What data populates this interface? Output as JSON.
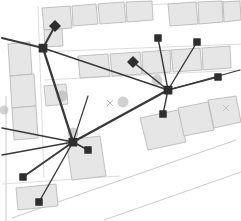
{
  "view": {
    "type": "map-network-overlay",
    "width": 241,
    "height": 221,
    "background_color": "#ffffff",
    "title": "Network links over building footprint map"
  },
  "style": {
    "building_fill": "#e6e6e6",
    "building_stroke": "#b4b4b4",
    "parcel_stroke": "#d8d8d8",
    "road_stroke": "#cfcfcf",
    "edge_color": "#3a3a3a",
    "node_color": "#2e2e2e",
    "halo_color": "#b5b5b5",
    "cross_color": "#bdbdbd"
  },
  "legend_note": "",
  "nodes": [
    {
      "id": "hub-a",
      "name": "hub-node-a",
      "x": 43,
      "y": 48,
      "shape": "square",
      "size": 7,
      "role": "hub"
    },
    {
      "id": "hub-b",
      "name": "hub-node-b",
      "x": 168,
      "y": 90,
      "shape": "square",
      "size": 7,
      "role": "hub"
    },
    {
      "id": "hub-c",
      "name": "hub-node-c",
      "x": 73,
      "y": 142,
      "shape": "square",
      "size": 7,
      "role": "hub"
    },
    {
      "id": "n1",
      "name": "endpoint-top-left",
      "x": 55,
      "y": 26,
      "shape": "diamond",
      "size": 6,
      "role": "endpoint"
    },
    {
      "id": "n2",
      "name": "endpoint-mid-center",
      "x": 133,
      "y": 62,
      "shape": "diamond",
      "size": 6,
      "role": "endpoint"
    },
    {
      "id": "n3",
      "name": "endpoint-top-center",
      "x": 158,
      "y": 38,
      "shape": "square",
      "size": 6,
      "role": "endpoint"
    },
    {
      "id": "n4",
      "name": "endpoint-top-right",
      "x": 197,
      "y": 42,
      "shape": "square",
      "size": 6,
      "role": "endpoint"
    },
    {
      "id": "n5",
      "name": "endpoint-right",
      "x": 218,
      "y": 77,
      "shape": "square",
      "size": 6,
      "role": "endpoint"
    },
    {
      "id": "n6",
      "name": "endpoint-lower-right",
      "x": 163,
      "y": 114,
      "shape": "square",
      "size": 6,
      "role": "endpoint"
    },
    {
      "id": "n7",
      "name": "endpoint-below-hub-c",
      "x": 88,
      "y": 150,
      "shape": "square",
      "size": 6,
      "role": "endpoint"
    },
    {
      "id": "n8",
      "name": "endpoint-bottom-left",
      "x": 23,
      "y": 177,
      "shape": "square",
      "size": 6,
      "role": "endpoint"
    },
    {
      "id": "n9",
      "name": "endpoint-bottom",
      "x": 39,
      "y": 202,
      "shape": "square",
      "size": 6,
      "role": "endpoint"
    }
  ],
  "edges": [
    {
      "name": "edge-huba-n1",
      "from": "hub-a",
      "to": "n1",
      "width": 2.0
    },
    {
      "name": "edge-huba-left",
      "x1": 43,
      "y1": 48,
      "x2": 2,
      "y2": 38,
      "width": 2.0
    },
    {
      "name": "edge-huba-hubc",
      "from": "hub-a",
      "to": "hub-c",
      "width": 2.4
    },
    {
      "name": "edge-huba-hubb",
      "from": "hub-a",
      "to": "hub-b",
      "width": 1.6
    },
    {
      "name": "edge-hubb-n2",
      "from": "hub-b",
      "to": "n2",
      "width": 1.6
    },
    {
      "name": "edge-hubb-n3",
      "from": "hub-b",
      "to": "n3",
      "width": 1.4
    },
    {
      "name": "edge-hubb-n4",
      "from": "hub-b",
      "to": "n4",
      "width": 1.4
    },
    {
      "name": "edge-hubb-n5",
      "from": "hub-b",
      "to": "n5",
      "width": 1.4
    },
    {
      "name": "edge-hubb-n6",
      "from": "hub-b",
      "to": "n6",
      "width": 1.4
    },
    {
      "name": "edge-hubb-hubc",
      "from": "hub-b",
      "to": "hub-c",
      "width": 2.4
    },
    {
      "name": "edge-hubc-n7",
      "from": "hub-c",
      "to": "n7",
      "width": 1.6
    },
    {
      "name": "edge-hubc-n8",
      "from": "hub-c",
      "to": "n8",
      "width": 2.0
    },
    {
      "name": "edge-hubc-n9",
      "from": "hub-c",
      "to": "n9",
      "width": 1.4
    },
    {
      "name": "edge-hubc-west",
      "x1": 73,
      "y1": 142,
      "x2": 2,
      "y2": 128,
      "width": 1.6
    },
    {
      "name": "edge-hubc-left2",
      "x1": 73,
      "y1": 142,
      "x2": 2,
      "y2": 155,
      "width": 1.4
    },
    {
      "name": "edge-hubc-north",
      "x1": 73,
      "y1": 142,
      "x2": 88,
      "y2": 96,
      "width": 1.2
    },
    {
      "name": "edge-hubb-far-east",
      "x1": 168,
      "y1": 90,
      "x2": 240,
      "y2": 70,
      "width": 1.2
    }
  ],
  "halos": [
    {
      "name": "halo-marker-1",
      "x": 62,
      "y": 96,
      "r": 5.5
    },
    {
      "name": "halo-marker-2",
      "x": 123,
      "y": 102,
      "r": 5.5
    },
    {
      "name": "halo-marker-3",
      "x": 73,
      "y": 133,
      "r": 5.5
    },
    {
      "name": "halo-marker-4",
      "x": 157,
      "y": 80,
      "r": 5.5
    },
    {
      "name": "halo-marker-5",
      "x": 4,
      "y": 110,
      "r": 4.5
    }
  ],
  "cross_marks": [
    {
      "name": "cross-mark-center",
      "x": 110,
      "y": 103,
      "size": 3
    },
    {
      "name": "cross-mark-right",
      "x": 226,
      "y": 108,
      "size": 3
    }
  ],
  "buildings": [
    {
      "name": "building-top-left-a",
      "points": "42,8 70,6 72,28 44,30"
    },
    {
      "name": "building-top-left-b",
      "points": "44,30 62,29 63,46 45,47"
    },
    {
      "name": "building-top-left-c",
      "points": "72,6 96,4 98,24 73,26"
    },
    {
      "name": "building-top-mid-a",
      "points": "98,4 124,2 126,22 100,24"
    },
    {
      "name": "building-top-mid-b",
      "points": "126,2 152,1 153,20 127,22"
    },
    {
      "name": "building-top-right-a",
      "points": "168,4 196,2 198,24 170,26"
    },
    {
      "name": "building-top-right-b",
      "points": "198,2 222,1 223,22 199,24"
    },
    {
      "name": "building-top-right-c",
      "points": "223,2 240,1 241,20 224,22"
    },
    {
      "name": "building-row-a",
      "points": "78,56 108,54 110,76 80,78"
    },
    {
      "name": "building-row-b",
      "points": "110,54 140,52 142,74 112,76"
    },
    {
      "name": "building-row-c",
      "points": "142,52 170,50 171,72 143,74"
    },
    {
      "name": "building-row-d",
      "points": "171,50 200,48 202,70 173,72"
    },
    {
      "name": "building-row-e",
      "points": "202,48 230,46 231,68 203,70"
    },
    {
      "name": "building-left-col-a",
      "points": "8,44 30,42 32,74 10,76"
    },
    {
      "name": "building-left-col-b",
      "points": "10,76 34,74 36,106 12,108"
    },
    {
      "name": "building-left-col-c",
      "points": "12,108 36,106 38,138 14,140"
    },
    {
      "name": "building-mid-small",
      "points": "44,86 66,84 68,104 46,106"
    },
    {
      "name": "building-lower-mid",
      "points": "66,140 100,136 106,176 72,180"
    },
    {
      "name": "building-lower-left",
      "points": "16,188 56,184 58,206 18,210"
    },
    {
      "name": "building-lower-right-a",
      "points": "140,118 178,110 186,142 148,150"
    },
    {
      "name": "building-lower-right-b",
      "points": "178,108 208,102 214,130 184,136"
    },
    {
      "name": "building-lower-right-c",
      "points": "208,100 236,96 241,122 214,128"
    }
  ],
  "parcel_lines": [
    {
      "name": "parcel-line-top",
      "x1": 42,
      "y1": 9,
      "x2": 241,
      "y2": 1
    },
    {
      "name": "parcel-line-row-top",
      "x1": 40,
      "y1": 52,
      "x2": 241,
      "y2": 44
    },
    {
      "name": "parcel-line-row-bot",
      "x1": 44,
      "y1": 80,
      "x2": 241,
      "y2": 70
    },
    {
      "name": "parcel-line-left-v",
      "x1": 38,
      "y1": 6,
      "x2": 44,
      "y2": 178
    },
    {
      "name": "parcel-line-lower",
      "x1": 2,
      "y1": 184,
      "x2": 120,
      "y2": 176
    }
  ],
  "roads": [
    {
      "name": "road-diagonal-a",
      "x1": 12,
      "y1": 218,
      "x2": 236,
      "y2": 140
    },
    {
      "name": "road-diagonal-b",
      "x1": 104,
      "y1": 220,
      "x2": 241,
      "y2": 172
    },
    {
      "name": "road-edge-left",
      "x1": 6,
      "y1": 96,
      "x2": 6,
      "y2": 221
    }
  ]
}
